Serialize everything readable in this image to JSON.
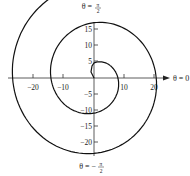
{
  "chart_data": {
    "type": "line",
    "title": "",
    "curve": "r = 4.7 + 2*(pi/2 - phi), phi decreasing from pi/2",
    "phi_start_deg": 90,
    "phi_end_deg": -632,
    "approx_crossings": [
      {
        "where": "positive y",
        "value": 4.7
      },
      {
        "where": "positive x",
        "value": 7.6
      },
      {
        "where": "negative y",
        "value": -10
      },
      {
        "where": "negative x",
        "value": -12.5
      },
      {
        "where": "positive y",
        "value": 16
      },
      {
        "where": "positive x",
        "value": 19.5
      },
      {
        "where": "negative y",
        "value": -21.5
      },
      {
        "where": "negative x (arrow end)",
        "value": -26
      }
    ],
    "x_ticks": [
      -20,
      -10,
      10,
      20
    ],
    "y_ticks": [
      15,
      10,
      5,
      -5,
      -10,
      -15,
      -20
    ],
    "xlim": [
      -29,
      23
    ],
    "ylim": [
      -25,
      22
    ],
    "grid": false,
    "legend": null,
    "axis_labels": {
      "top": "θ = π/2",
      "right": "θ = 0",
      "bottom": "θ = −π/2"
    }
  },
  "labels": {
    "top_prefix": "θ =",
    "top_num": "π",
    "top_den": "2",
    "right": "θ = 0",
    "bottom_prefix": "θ = −",
    "bottom_num": "π",
    "bottom_den": "2",
    "x_ticks": [
      "−20",
      "−10",
      "10",
      "20"
    ],
    "y_ticks": [
      "15",
      "10",
      "5",
      "−5",
      "−10",
      "−15",
      "−20"
    ]
  }
}
